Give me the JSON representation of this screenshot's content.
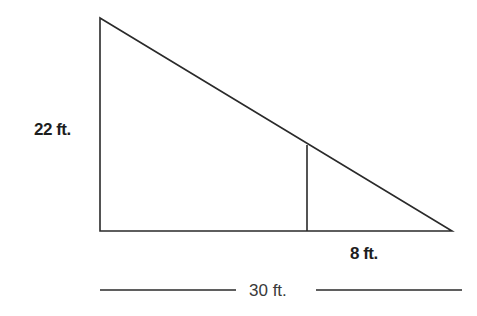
{
  "diagram": {
    "type": "similar-triangles",
    "labels": {
      "height": "22 ft.",
      "small_base": "8 ft.",
      "total_base": "30 ft."
    },
    "colors": {
      "stroke": "#2a2a2a",
      "text": "#1e1e1e",
      "background": "#ffffff"
    }
  }
}
